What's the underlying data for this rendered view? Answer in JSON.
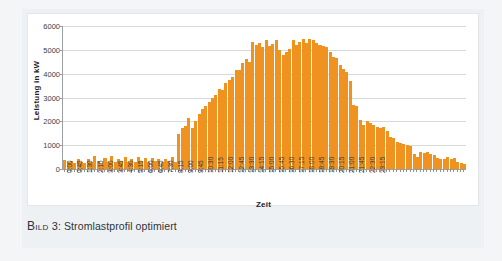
{
  "figure": {
    "caption_prefix": "Bild",
    "caption_number": "3",
    "caption_separator": ":",
    "caption_text": "Stromlastprofil optimiert"
  },
  "colors": {
    "bar": "#f0921f",
    "grid": "#d7dadd",
    "axis": "#9aa0a4",
    "card_background": "#ffffff",
    "page_background": "#eef1f3"
  },
  "chart_data": {
    "type": "bar",
    "title": "",
    "xlabel": "Zeit",
    "ylabel": "Leistung in kW",
    "ylim": [
      0,
      6000
    ],
    "ytick_values": [
      0,
      1000,
      2000,
      3000,
      4000,
      5000,
      6000
    ],
    "ytick_labels": [
      "0",
      "1000",
      "2000",
      "3000",
      "4000",
      "5000",
      "6000"
    ],
    "grid": true,
    "legend": false,
    "interval_minutes": 15,
    "label_every_n_bars": 3,
    "categories": [
      "0:00",
      "0:15",
      "0:30",
      "0:45",
      "1:00",
      "1:15",
      "1:30",
      "1:45",
      "2:00",
      "2:15",
      "2:30",
      "2:45",
      "3:00",
      "3:15",
      "3:30",
      "3:45",
      "4:00",
      "4:15",
      "4:30",
      "4:45",
      "5:00",
      "5:15",
      "5:30",
      "5:45",
      "6:00",
      "6:15",
      "6:30",
      "6:45",
      "7:00",
      "7:15",
      "7:30",
      "7:45",
      "8:00",
      "8:15",
      "8:30",
      "8:45",
      "9:00",
      "9:15",
      "9:30",
      "9:45",
      "10:00",
      "10:15",
      "10:30",
      "10:45",
      "11:00",
      "11:15",
      "11:30",
      "11:45",
      "12:00",
      "12:15",
      "12:30",
      "12:45",
      "13:00",
      "13:15",
      "13:30",
      "13:45",
      "14:00",
      "14:15",
      "14:30",
      "14:45",
      "15:00",
      "15:15",
      "15:30",
      "15:45",
      "16:00",
      "16:15",
      "16:30",
      "16:45",
      "17:00",
      "17:15",
      "17:30",
      "17:45",
      "18:00",
      "18:15",
      "18:30",
      "18:45",
      "19:00",
      "19:15",
      "19:30",
      "19:45",
      "20:00",
      "20:15",
      "20:30",
      "20:45",
      "21:00",
      "21:15",
      "21:30",
      "21:45",
      "22:00",
      "22:15",
      "22:30",
      "22:45",
      "23:00",
      "23:15",
      "23:30",
      "23:45"
    ],
    "tick_labels_shown": [
      "0:00",
      "0:45",
      "1:30",
      "2:15",
      "3:00",
      "3:45",
      "4:30",
      "5:15",
      "6:00",
      "6:45",
      "7:30",
      "8:15",
      "9:00",
      "9:45",
      "10:30",
      "11:15",
      "12:00",
      "12:45",
      "13:30",
      "14:15",
      "15:00",
      "15:45",
      "16:30",
      "17:15",
      "18:00",
      "18:45",
      "19:30",
      "20:15",
      "21:00",
      "21:45",
      "22:30",
      "23:15"
    ],
    "values": [
      380,
      300,
      330,
      250,
      420,
      300,
      260,
      400,
      300,
      560,
      320,
      260,
      470,
      300,
      560,
      280,
      430,
      320,
      500,
      300,
      420,
      310,
      500,
      330,
      450,
      300,
      480,
      330,
      420,
      300,
      430,
      330,
      520,
      300,
      1450,
      1700,
      1800,
      2150,
      1700,
      2000,
      2300,
      2500,
      2650,
      2800,
      3000,
      3100,
      3350,
      3300,
      3600,
      3750,
      3850,
      4150,
      4150,
      4450,
      4600,
      4500,
      5350,
      5200,
      5300,
      5100,
      5400,
      5150,
      5250,
      5400,
      5000,
      4800,
      4900,
      5050,
      5400,
      5200,
      5350,
      5450,
      5300,
      5450,
      5400,
      5300,
      5200,
      5150,
      5100,
      4900,
      4700,
      4650,
      4350,
      4200,
      4050,
      3700,
      2700,
      2650,
      2050,
      1850,
      2000,
      1950,
      1850,
      1750,
      1700,
      1750
    ],
    "values_extended": [
      1600,
      1350,
      1300,
      1150,
      1100,
      1050,
      1000,
      950,
      620,
      500,
      700,
      660,
      700,
      640,
      580,
      470,
      440,
      430,
      520,
      440,
      480,
      300,
      260,
      230
    ]
  }
}
